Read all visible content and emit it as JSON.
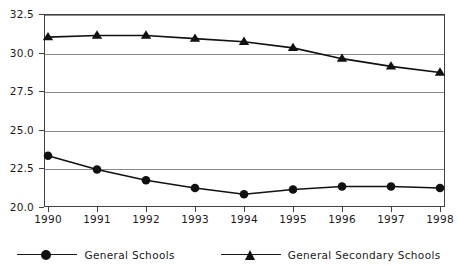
{
  "chart_data": {
    "type": "line",
    "title": "",
    "xlabel": "",
    "ylabel": "",
    "categories": [
      "1990",
      "1991",
      "1992",
      "1993",
      "1994",
      "1995",
      "1996",
      "1997",
      "1998"
    ],
    "x": [
      1990,
      1991,
      1992,
      1993,
      1994,
      1995,
      1996,
      1997,
      1998
    ],
    "series": [
      {
        "name": "General Schools",
        "marker": "circle",
        "color": "#111111",
        "values": [
          23.3,
          22.4,
          21.7,
          21.2,
          20.8,
          21.1,
          21.3,
          21.3,
          21.2
        ]
      },
      {
        "name": "General Secondary Schools",
        "marker": "triangle",
        "color": "#111111",
        "values": [
          31.0,
          31.1,
          31.1,
          30.9,
          30.7,
          30.3,
          29.6,
          29.1,
          28.7
        ]
      }
    ],
    "ylim": [
      20.0,
      32.5
    ],
    "yticks": [
      20.0,
      22.5,
      25.0,
      27.5,
      30.0,
      32.5
    ],
    "ytick_labels": [
      "20.0",
      "22.5",
      "25.0",
      "27.5",
      "30.0",
      "32.5"
    ],
    "grid": true,
    "legend_position": "bottom",
    "annotations": []
  },
  "legend": {
    "items": [
      {
        "label": "General Schools",
        "marker": "circle"
      },
      {
        "label": "General Secondary Schools",
        "marker": "triangle"
      }
    ]
  },
  "colors": {
    "line": "#111111",
    "grid": "#8a8a8a",
    "frame": "#404040",
    "text": "#1a1a1a",
    "background": "#ffffff"
  }
}
